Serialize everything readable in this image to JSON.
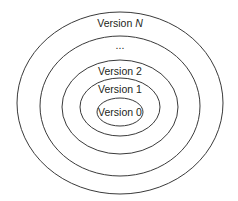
{
  "diagram": {
    "type": "nested-ellipses",
    "stroke_color": "#3a3a3a",
    "text_color": "#231f20",
    "rings": [
      {
        "name": "version-n",
        "label_prefix": "Version ",
        "label_var": "N",
        "cx": 120,
        "cy": 103,
        "rx": 103,
        "ry": 91,
        "label_y": 27
      },
      {
        "name": "ellipsis",
        "label": "...",
        "cx": 120,
        "cy": 106,
        "rx": 80,
        "ry": 70,
        "label_y": 49
      },
      {
        "name": "version-2",
        "label": "Version 2",
        "cx": 120,
        "cy": 107,
        "rx": 58,
        "ry": 47,
        "label_y": 75
      },
      {
        "name": "version-1",
        "label": "Version 1",
        "cx": 120,
        "cy": 107,
        "rx": 40,
        "ry": 29,
        "label_y": 93
      },
      {
        "name": "version-0",
        "label": "Version 0",
        "cx": 120,
        "cy": 112,
        "rx": 23,
        "ry": 14,
        "label_y": 116
      }
    ]
  }
}
